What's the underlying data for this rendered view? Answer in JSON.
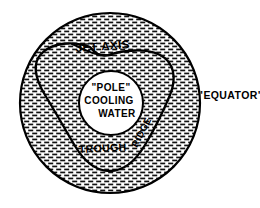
{
  "figure": {
    "background_color": "#ffffff",
    "ink_color": "#000000"
  },
  "outer_region": {
    "name": "hatched disk",
    "fill_style": "brick-dash stipple hatching",
    "boundary_label": "\"EQUATOR\"",
    "center_x": 110,
    "center_y": 103,
    "radius": 90
  },
  "jet_axis": {
    "label": "JET AXIS",
    "wave_number": 3,
    "lobes": [
      "upper-left ridge",
      "right ridge",
      "lower trough"
    ]
  },
  "core": {
    "line1": "\"POLE\"",
    "line2": "COOLING",
    "line3": "WATER",
    "center_x": 111,
    "center_y": 103,
    "radius": 32,
    "fill_color": "#ffffff"
  },
  "annotations": {
    "trough": "TROUGH",
    "ridge": "RIDGE",
    "equator": "\"EQUATOR\"",
    "jet_axis": "JET AXIS"
  }
}
